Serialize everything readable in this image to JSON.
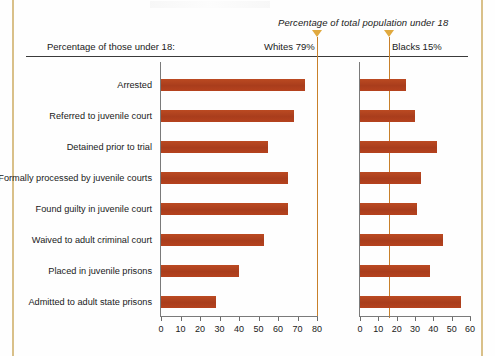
{
  "header": {
    "legend_note": "Percentage of total population under 18",
    "left_caption": "Percentage of those under 18:",
    "whites_marker": "Whites 79%",
    "blacks_marker": "Blacks 15%"
  },
  "colors": {
    "bar": "#b2431f",
    "reference_line": "#c8802a",
    "marker_triangle": "#e0a93f",
    "frame_rule": "#d9c089",
    "axis": "#7a7a7a"
  },
  "chart_data": {
    "type": "bar",
    "title": "",
    "subtitle": "Percentage of total population under 18",
    "xlabel": "",
    "ylabel": "",
    "grid": false,
    "orientation": "horizontal",
    "legend_position": "top",
    "categories": [
      "Arrested",
      "Referred to juvenile court",
      "Detained prior to trial",
      "Formally processed by juvenile courts",
      "Found guilty in juvenile court",
      "Waived to adult criminal court",
      "Placed in juvenile prisons",
      "Admitted to adult state prisons"
    ],
    "panels": [
      {
        "name": "Whites",
        "marker_label": "Whites 79%",
        "reference_value": 79,
        "xlim": [
          0,
          80
        ],
        "xticks": [
          0,
          10,
          20,
          30,
          40,
          50,
          60,
          70,
          80
        ],
        "values": [
          74,
          68,
          55,
          65,
          65,
          53,
          40,
          28
        ]
      },
      {
        "name": "Blacks",
        "marker_label": "Blacks 15%",
        "reference_value": 15,
        "xlim": [
          0,
          60
        ],
        "xticks": [
          0,
          10,
          20,
          30,
          40,
          50,
          60
        ],
        "values": [
          25,
          30,
          42,
          33,
          31,
          45,
          38,
          55
        ]
      }
    ]
  }
}
